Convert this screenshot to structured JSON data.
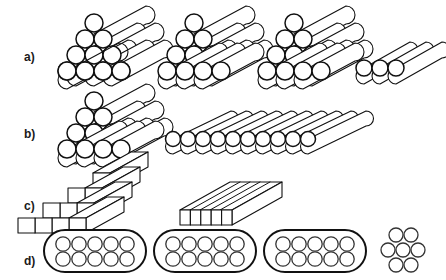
{
  "figure": {
    "width": 446,
    "height": 280,
    "background": "#ffffff",
    "line_color": "#111111"
  },
  "rows": [
    {
      "id": "row-a",
      "label": "a)",
      "label_x": 24,
      "label_y": 58,
      "description": "Triangular close-packed bundles of cylindrical rods plus a single flat triplet",
      "items": [
        {
          "id": "a-stack-1",
          "kind": "rod-pyramid",
          "x": 58,
          "y": 6,
          "layers": [
            4,
            3,
            2,
            1
          ],
          "rod_count": 10,
          "circle_radius": 9.0,
          "depth_x": 52,
          "depth_y": -30
        },
        {
          "id": "a-stack-2",
          "kind": "rod-pyramid",
          "x": 158,
          "y": 6,
          "layers": [
            4,
            3,
            2,
            1
          ],
          "rod_count": 10,
          "circle_radius": 9.0,
          "depth_x": 52,
          "depth_y": -30
        },
        {
          "id": "a-stack-3",
          "kind": "rod-pyramid",
          "x": 258,
          "y": 6,
          "layers": [
            4,
            3,
            2,
            1
          ],
          "rod_count": 10,
          "circle_radius": 9.0,
          "depth_x": 52,
          "depth_y": -30
        },
        {
          "id": "a-triplet",
          "kind": "rod-row",
          "x": 358,
          "y": 36,
          "rod_count": 3,
          "circle_radius": 8.0,
          "depth_x": 46,
          "depth_y": -26
        }
      ]
    },
    {
      "id": "row-b",
      "label": "b)",
      "label_x": 24,
      "label_y": 135,
      "description": "One triangular rod bundle and one single-layer raft of ten rods",
      "items": [
        {
          "id": "b-stack-1",
          "kind": "rod-pyramid",
          "x": 58,
          "y": 84,
          "layers": [
            4,
            3,
            2,
            1
          ],
          "rod_count": 10,
          "circle_radius": 9.0,
          "depth_x": 52,
          "depth_y": -30
        },
        {
          "id": "b-raft",
          "kind": "rod-row",
          "x": 168,
          "y": 108,
          "rod_count": 10,
          "circle_radius": 7.5,
          "depth_x": 58,
          "depth_y": -28
        }
      ]
    },
    {
      "id": "row-c",
      "label": "c)",
      "label_x": 24,
      "label_y": 207,
      "description": "Stepped pyramid of rectangular bars and a flat slab of five bars",
      "items": [
        {
          "id": "c-stack-1",
          "kind": "bar-pyramid",
          "x": 60,
          "y": 155,
          "layers": [
            4,
            3,
            2,
            1
          ],
          "bar_count": 10,
          "bar_width": 17,
          "bar_height": 15,
          "depth_x": 38,
          "depth_y": -24
        },
        {
          "id": "c-slab",
          "kind": "bar-row",
          "x": 176,
          "y": 186,
          "bar_count": 5,
          "bar_width": 17,
          "bar_height": 15,
          "depth_x": 52,
          "depth_y": -30
        }
      ]
    },
    {
      "id": "row-d",
      "label": "d)",
      "label_x": 24,
      "label_y": 262,
      "description": "Three capsule cross-sections each holding ten circles, plus a free hexagonal cluster of seven",
      "items": [
        {
          "id": "d-pill-1",
          "kind": "pill",
          "x": 42,
          "y": 228,
          "width": 104,
          "height": 44,
          "rows": 2,
          "cols": 5,
          "circle_count": 10,
          "circle_radius": 7.2
        },
        {
          "id": "d-pill-2",
          "kind": "pill",
          "x": 152,
          "y": 228,
          "width": 104,
          "height": 44,
          "rows": 2,
          "cols": 5,
          "circle_count": 10,
          "circle_radius": 7.2
        },
        {
          "id": "d-pill-3",
          "kind": "pill",
          "x": 262,
          "y": 228,
          "width": 104,
          "height": 44,
          "rows": 2,
          "cols": 5,
          "circle_count": 10,
          "circle_radius": 7.2
        },
        {
          "id": "d-cluster",
          "kind": "hex-cluster",
          "x": 380,
          "y": 228,
          "layers": [
            2,
            3,
            2
          ],
          "circle_count": 7,
          "circle_radius": 7.0
        }
      ]
    }
  ]
}
